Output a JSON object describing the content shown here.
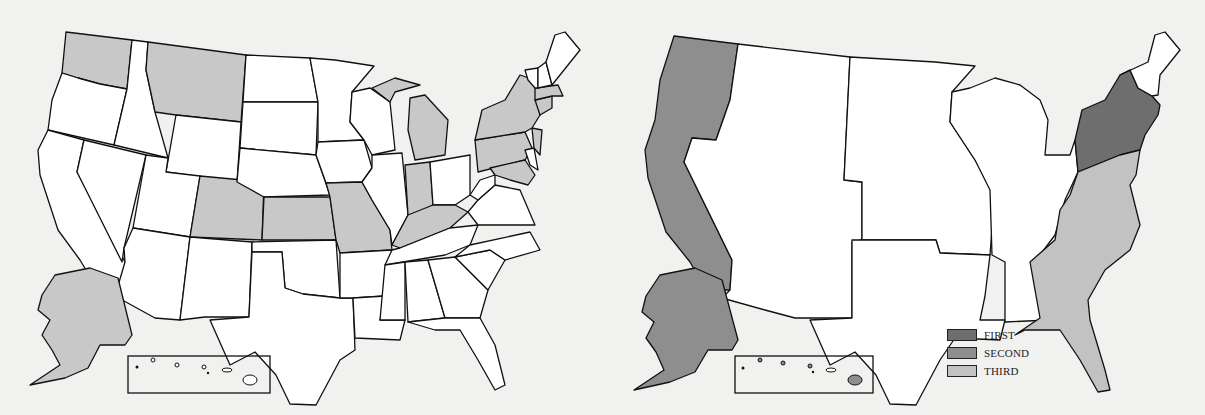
{
  "colors": {
    "background": "#f1f1ef",
    "unshaded": "#ffffff",
    "left_shaded": "#c8c8c8",
    "first": "#6e6e6e",
    "second": "#8e8e8e",
    "third": "#c2c2c2",
    "outline": "#111111"
  },
  "left_map": {
    "title": "",
    "shaded_states": [
      "Washington",
      "Montana",
      "Colorado",
      "Kansas",
      "Missouri",
      "Kentucky",
      "Indiana",
      "Michigan",
      "Pennsylvania",
      "New York",
      "Maryland",
      "Massachusetts",
      "Connecticut",
      "New Jersey",
      "Alaska"
    ]
  },
  "right_map": {
    "title": "",
    "regions": [
      {
        "name": "Northeast (NY/PA/NJ/New England south)",
        "category": "FIRST"
      },
      {
        "name": "Pacific (WA/OR/CA)",
        "category": "SECOND"
      },
      {
        "name": "Alaska",
        "category": "SECOND"
      },
      {
        "name": "Hawaii",
        "category": "SECOND"
      },
      {
        "name": "South Atlantic",
        "category": "THIRD"
      }
    ],
    "legend": [
      {
        "label": "FIRST",
        "color": "#6e6e6e"
      },
      {
        "label": "SECOND",
        "color": "#8e8e8e"
      },
      {
        "label": "THIRD",
        "color": "#c2c2c2"
      }
    ]
  }
}
